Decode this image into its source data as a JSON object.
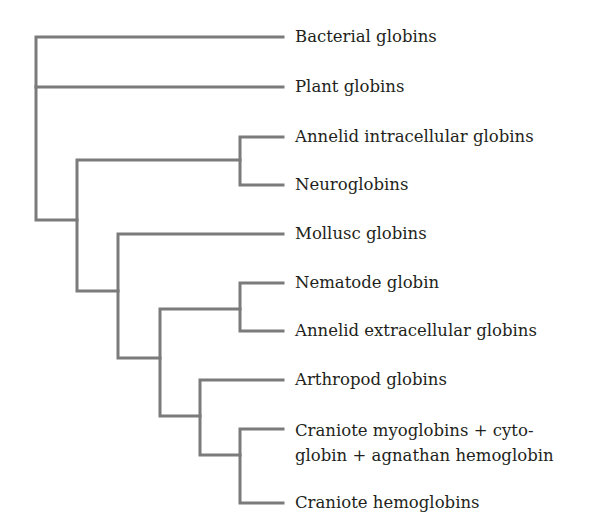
{
  "diagram": {
    "type": "phylogenetic-tree",
    "line_color": "#7b7b7b",
    "text_color": "#231f20",
    "leaves": [
      {
        "id": "bacterial",
        "label": "Bacterial globins",
        "y": 37
      },
      {
        "id": "plant",
        "label": "Plant globins",
        "y": 87
      },
      {
        "id": "annelid_intra",
        "label": "Annelid intracellular globins",
        "y": 137
      },
      {
        "id": "neuro",
        "label": "Neuroglobins",
        "y": 185
      },
      {
        "id": "mollusc",
        "label": "Mollusc globins",
        "y": 234
      },
      {
        "id": "nematode",
        "label": "Nematode globin",
        "y": 283
      },
      {
        "id": "annelid_extra",
        "label": "Annelid extracellular globins",
        "y": 331
      },
      {
        "id": "arthropod",
        "label": "Arthropod globins",
        "y": 380
      },
      {
        "id": "craniote_myo",
        "label": "Craniote myoglobins + cyto-\nglobin + agnathan hemoglobin",
        "y": 429
      },
      {
        "id": "craniote_hemo",
        "label": "Craniote hemoglobins",
        "y": 503
      }
    ],
    "clades": [
      {
        "node": "root",
        "children": [
          "bacterial",
          "plant",
          "n1"
        ]
      },
      {
        "node": "n1",
        "children": [
          "n2",
          "n3"
        ]
      },
      {
        "node": "n2",
        "children": [
          "annelid_intra",
          "neuro"
        ]
      },
      {
        "node": "n3",
        "children": [
          "mollusc",
          "n4"
        ]
      },
      {
        "node": "n4",
        "children": [
          "n5",
          "n6"
        ]
      },
      {
        "node": "n5",
        "children": [
          "nematode",
          "annelid_extra"
        ]
      },
      {
        "node": "n6",
        "children": [
          "arthropod",
          "n7"
        ]
      },
      {
        "node": "n7",
        "children": [
          "craniote_myo",
          "craniote_hemo"
        ]
      }
    ]
  }
}
